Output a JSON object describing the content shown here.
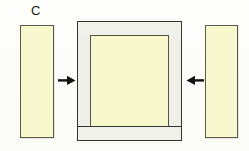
{
  "figure": {
    "panel_label": "C",
    "type": "assembly-diagram",
    "background_color": "#fdfdfb"
  },
  "colors": {
    "cream_fill": "#f8f8cf",
    "cream_border": "#55553f",
    "rail_fill": "#f1f1ec",
    "stile_fill": "#efefe9",
    "rail_border": "#34342c",
    "arrow_color": "#111111",
    "label_color": "#1b1b18"
  },
  "parts": {
    "side_member_left": {
      "name": "left-side-member",
      "fill": "#f8f8cf",
      "x": 20,
      "y": 25,
      "w": 34,
      "h": 113
    },
    "side_member_right": {
      "name": "right-side-member",
      "fill": "#f8f8cf",
      "x": 205,
      "y": 25,
      "w": 33,
      "h": 113
    },
    "frame": {
      "name": "center-frame",
      "x": 77,
      "y": 21,
      "w": 105,
      "h": 120,
      "top_rail": {
        "fill": "#f1f1ec",
        "h": 15
      },
      "bottom_rail": {
        "fill": "#f1f1ec",
        "h": 15
      },
      "left_stile": {
        "fill": "#efefe9",
        "w": 14
      },
      "right_stile": {
        "fill": "#efefe9",
        "w": 14
      },
      "inner_panel": {
        "fill": "#f8f8cf",
        "w": 79,
        "h": 92
      }
    }
  },
  "arrows": [
    {
      "name": "arrow-left",
      "direction": "right",
      "meaning": "left side member inserts toward frame",
      "x": 58,
      "y": 75
    },
    {
      "name": "arrow-right",
      "direction": "left",
      "meaning": "right side member inserts toward frame",
      "x": 186,
      "y": 75
    }
  ]
}
